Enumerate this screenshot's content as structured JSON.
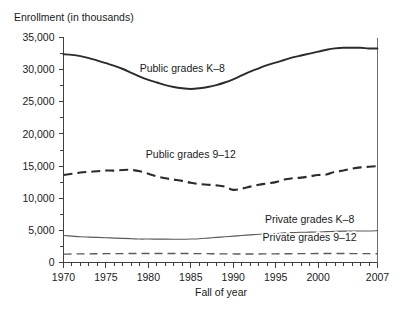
{
  "chart_data": {
    "type": "line",
    "title": "",
    "ylabel": "Enrollment (in thousands)",
    "xlabel": "Fall of year",
    "grid": false,
    "legend_position": "inline-annotations",
    "xlim": [
      1970,
      2007
    ],
    "ylim": [
      0,
      35000
    ],
    "y_ticks": [
      0,
      5000,
      10000,
      15000,
      20000,
      25000,
      30000,
      35000
    ],
    "y_tick_labels": [
      "0",
      "5,000",
      "10,000",
      "15,000",
      "20,000",
      "25,000",
      "30,000",
      "35,000"
    ],
    "y_minor_tick_step": 2500,
    "x_ticks": [
      1970,
      1975,
      1980,
      1985,
      1990,
      1995,
      2000,
      2007
    ],
    "x_tick_labels": [
      "1970",
      "1975",
      "1980",
      "1985",
      "1990",
      "1995",
      "2000",
      "2007"
    ],
    "x_minor_tick_step": 1,
    "x": [
      1970,
      1971,
      1972,
      1973,
      1974,
      1975,
      1976,
      1977,
      1978,
      1979,
      1980,
      1981,
      1982,
      1983,
      1984,
      1985,
      1986,
      1987,
      1988,
      1989,
      1990,
      1991,
      1992,
      1993,
      1994,
      1995,
      1996,
      1997,
      1998,
      1999,
      2000,
      2001,
      2002,
      2003,
      2004,
      2005,
      2006,
      2007
    ],
    "series": [
      {
        "name": "Public grades K-8",
        "style": "solid",
        "weight": "bold",
        "color": "#2b2b2b",
        "label_text": "Public grades K–8",
        "values": [
          32400,
          32300,
          32100,
          31800,
          31400,
          31000,
          30600,
          30100,
          29500,
          28900,
          28400,
          28000,
          27600,
          27300,
          27100,
          27000,
          27100,
          27300,
          27600,
          28000,
          28500,
          29100,
          29700,
          30200,
          30700,
          31100,
          31500,
          31900,
          32200,
          32500,
          32800,
          33100,
          33300,
          33400,
          33400,
          33400,
          33300,
          33300
        ]
      },
      {
        "name": "Public grades 9-12",
        "style": "dashed",
        "weight": "bold",
        "color": "#2b2b2b",
        "label_text": "Public grades 9–12",
        "values": [
          13600,
          13800,
          14000,
          14100,
          14200,
          14300,
          14300,
          14400,
          14400,
          14200,
          13800,
          13400,
          13100,
          12900,
          12700,
          12400,
          12200,
          12100,
          12000,
          11800,
          11300,
          11500,
          11800,
          12100,
          12300,
          12500,
          12900,
          13100,
          13200,
          13400,
          13600,
          13700,
          14100,
          14300,
          14600,
          14800,
          14900,
          15000
        ]
      },
      {
        "name": "Private grades K-8",
        "style": "solid",
        "weight": "thin",
        "color": "#5a5a5a",
        "label_text": "Private grades K–8",
        "values": [
          4200,
          4100,
          4000,
          3950,
          3900,
          3850,
          3800,
          3750,
          3700,
          3650,
          3650,
          3640,
          3630,
          3620,
          3620,
          3650,
          3700,
          3800,
          3900,
          4000,
          4100,
          4200,
          4300,
          4400,
          4450,
          4500,
          4600,
          4650,
          4700,
          4720,
          4750,
          4800,
          4850,
          4870,
          4900,
          4900,
          4900,
          4950
        ]
      },
      {
        "name": "Private grades 9-12",
        "style": "dashed",
        "weight": "thin",
        "color": "#5a5a5a",
        "label_text": "Private grades 9–12",
        "values": [
          1300,
          1320,
          1340,
          1350,
          1360,
          1370,
          1380,
          1390,
          1400,
          1400,
          1400,
          1400,
          1400,
          1400,
          1400,
          1390,
          1380,
          1370,
          1350,
          1340,
          1330,
          1330,
          1330,
          1330,
          1340,
          1350,
          1360,
          1370,
          1380,
          1390,
          1400,
          1400,
          1400,
          1400,
          1390,
          1380,
          1370,
          1360
        ]
      }
    ],
    "annotations": [
      {
        "text": "Public grades K–8",
        "x": 1984,
        "y": 29600
      },
      {
        "text": "Public grades 9–12",
        "x": 1985,
        "y": 16200
      },
      {
        "text": "Private grades K–8",
        "x": 1999,
        "y": 6100
      },
      {
        "text": "Private grades 9–12",
        "x": 1999,
        "y": 3300
      }
    ]
  },
  "labels": {
    "ylabel": "Enrollment (in thousands)",
    "xlabel": "Fall of year"
  }
}
